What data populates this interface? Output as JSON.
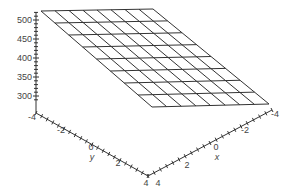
{
  "chart_data": {
    "type": "surface3d",
    "title": "",
    "x": {
      "label": "x",
      "range": [
        -4,
        4
      ],
      "ticks": [
        -4,
        -2,
        0,
        2,
        4
      ],
      "tick_labels": [
        "-4",
        "-2",
        "0",
        "2",
        "4"
      ]
    },
    "y": {
      "label": "y",
      "range": [
        -4,
        4
      ],
      "ticks": [
        -4,
        -2,
        0,
        2,
        4
      ],
      "tick_labels": [
        "-4",
        "-2",
        "0",
        "2",
        "4"
      ]
    },
    "z": {
      "label": "",
      "range": [
        280,
        520
      ],
      "ticks": [
        300,
        350,
        400,
        450,
        500
      ],
      "tick_labels": [
        "300",
        "350",
        "400",
        "450",
        "500"
      ],
      "minor_tick_step": 10
    },
    "grid": {
      "rows": 8,
      "cols": 8
    },
    "surface_corners": [
      {
        "x": -4,
        "y": -4,
        "z": 520
      },
      {
        "x": -4,
        "y": 4,
        "z": 520
      },
      {
        "x": 4,
        "y": 4,
        "z": 290
      },
      {
        "x": 4,
        "y": -4,
        "z": 290
      }
    ],
    "line_color": "#333333",
    "background": "#ffffff"
  },
  "labels": {
    "z_ticks": [
      "500",
      "450",
      "400",
      "350",
      "300"
    ],
    "y_ticks": [
      "-4",
      "-2",
      "0",
      "2",
      "4"
    ],
    "x_ticks": [
      "4",
      "2",
      "0",
      "-2",
      "-4"
    ],
    "y_axis_label": "y",
    "x_axis_label": "x"
  }
}
